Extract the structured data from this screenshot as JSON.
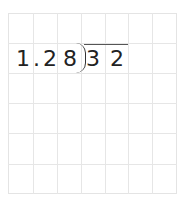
{
  "problem": {
    "type": "long-division",
    "divisor": [
      "1",
      ".",
      "2",
      "8"
    ],
    "dividend": [
      "3",
      "2"
    ]
  },
  "grid": {
    "columns": 7,
    "rows": 6,
    "line_color": "#e6e6e6"
  }
}
